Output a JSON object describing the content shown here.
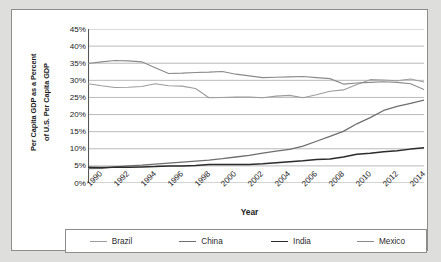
{
  "chart_data": {
    "type": "line",
    "title": "",
    "xlabel": "Year",
    "ylabel_line1": "Per Capita GDP as a Percent",
    "ylabel_line2": "of U.S. Per Capita GDP",
    "grid": true,
    "legend_position": "bottom",
    "xlim": [
      1990,
      2015
    ],
    "ylim": [
      0,
      45
    ],
    "ytick_labels": [
      "45%",
      "40%",
      "35%",
      "30%",
      "25%",
      "20%",
      "15%",
      "10%",
      "5%",
      "0%"
    ],
    "ytick_values": [
      45,
      40,
      35,
      30,
      25,
      20,
      15,
      10,
      5,
      0
    ],
    "xtick_labels": [
      "1990",
      "1992",
      "1994",
      "1996",
      "1998",
      "2000",
      "2002",
      "2004",
      "2006",
      "2008",
      "2010",
      "2012",
      "2014"
    ],
    "xtick_values": [
      1990,
      1992,
      1994,
      1996,
      1998,
      2000,
      2002,
      2004,
      2006,
      2008,
      2010,
      2012,
      2014
    ],
    "x": [
      1990,
      1991,
      1992,
      1993,
      1994,
      1995,
      1996,
      1997,
      1998,
      1999,
      2000,
      2001,
      2002,
      2003,
      2004,
      2005,
      2006,
      2007,
      2008,
      2009,
      2010,
      2011,
      2012,
      2013,
      2014,
      2015
    ],
    "series": [
      {
        "name": "Brazil",
        "color": "#9c9c9c",
        "width": 1.1,
        "values": [
          29.0,
          28.4,
          27.9,
          28.0,
          28.2,
          29.0,
          28.4,
          28.3,
          27.6,
          24.9,
          25.0,
          25.1,
          25.1,
          24.9,
          25.4,
          25.6,
          24.9,
          25.8,
          26.8,
          27.2,
          28.8,
          30.2,
          30.1,
          29.9,
          30.4,
          29.5
        ]
      },
      {
        "name": "China",
        "color": "#6e6e6e",
        "width": 1.3,
        "values": [
          4.2,
          4.3,
          4.7,
          5.0,
          5.2,
          5.5,
          5.8,
          6.1,
          6.4,
          6.7,
          7.1,
          7.6,
          8.1,
          8.7,
          9.3,
          9.8,
          10.8,
          12.2,
          13.6,
          15.1,
          17.3,
          19.1,
          21.2,
          22.4,
          23.3,
          24.2
        ]
      },
      {
        "name": "India",
        "color": "#2b2b2b",
        "width": 1.5,
        "values": [
          4.6,
          4.5,
          4.6,
          4.6,
          4.7,
          4.8,
          5.0,
          5.0,
          5.1,
          5.4,
          5.4,
          5.4,
          5.4,
          5.6,
          5.9,
          6.2,
          6.5,
          6.9,
          7.0,
          7.6,
          8.4,
          8.7,
          9.1,
          9.4,
          9.9,
          10.3
        ]
      },
      {
        "name": "Mexico",
        "color": "#8a8a8a",
        "width": 1.1,
        "values": [
          34.9,
          35.4,
          35.8,
          35.7,
          35.4,
          33.7,
          32.0,
          32.1,
          32.3,
          32.4,
          32.6,
          31.8,
          31.3,
          30.8,
          30.9,
          31.0,
          31.1,
          30.8,
          30.5,
          28.9,
          29.2,
          29.4,
          29.6,
          29.4,
          29.0,
          27.3
        ]
      }
    ]
  },
  "legend": {
    "items": [
      {
        "label": "Brazil"
      },
      {
        "label": "China"
      },
      {
        "label": "India"
      },
      {
        "label": "Mexico"
      }
    ]
  },
  "axis": {
    "x_title": "Year"
  }
}
